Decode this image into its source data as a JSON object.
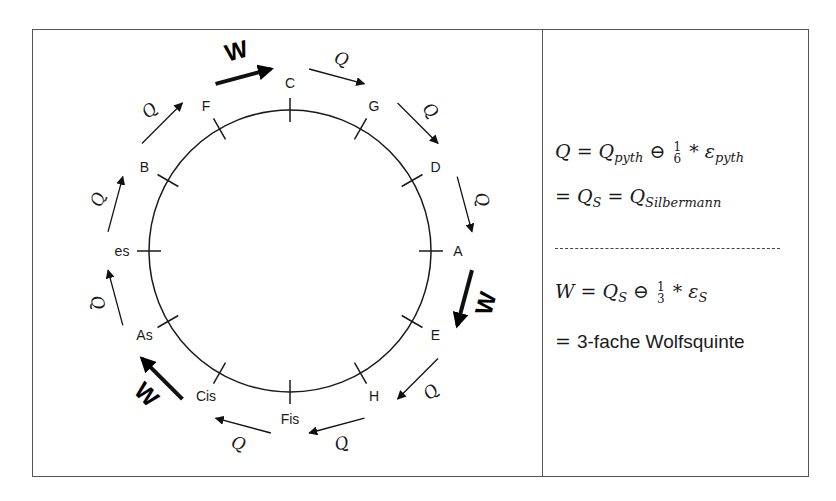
{
  "diagram": {
    "notes": [
      {
        "name": "C",
        "angle": 0
      },
      {
        "name": "G",
        "angle": 30
      },
      {
        "name": "D",
        "angle": 60
      },
      {
        "name": "A",
        "angle": 90
      },
      {
        "name": "E",
        "angle": 120
      },
      {
        "name": "H",
        "angle": 150
      },
      {
        "name": "Fis",
        "angle": 180
      },
      {
        "name": "Cis",
        "angle": 210
      },
      {
        "name": "As",
        "angle": 240
      },
      {
        "name": "es",
        "angle": 270
      },
      {
        "name": "B",
        "angle": 300
      },
      {
        "name": "F",
        "angle": 330
      }
    ],
    "intervals": [
      {
        "from": "C",
        "to": "G",
        "label": "Q",
        "type": "quint"
      },
      {
        "from": "G",
        "to": "D",
        "label": "Q",
        "type": "quint"
      },
      {
        "from": "D",
        "to": "A",
        "label": "Q",
        "type": "quint"
      },
      {
        "from": "A",
        "to": "E",
        "label": "W",
        "type": "wolf"
      },
      {
        "from": "E",
        "to": "H",
        "label": "Q",
        "type": "quint"
      },
      {
        "from": "H",
        "to": "Fis",
        "label": "Q",
        "type": "quint"
      },
      {
        "from": "Fis",
        "to": "Cis",
        "label": "Q",
        "type": "quint"
      },
      {
        "from": "Cis",
        "to": "As",
        "label": "W",
        "type": "wolf"
      },
      {
        "from": "As",
        "to": "es",
        "label": "Q",
        "type": "quint"
      },
      {
        "from": "es",
        "to": "B",
        "label": "Q",
        "type": "quint"
      },
      {
        "from": "B",
        "to": "F",
        "label": "Q",
        "type": "quint"
      },
      {
        "from": "F",
        "to": "C",
        "label": "W",
        "type": "wolf"
      }
    ]
  },
  "formulas": {
    "line1": {
      "lhs": "Q",
      "eq": "=",
      "term": "Q",
      "term_sub": "pyth",
      "op": "⊖",
      "frac_num": "1",
      "frac_den": "6",
      "mul": "*",
      "eps": "ε",
      "eps_sub": "pyth"
    },
    "line2": {
      "eq1": "=",
      "q1": "Q",
      "q1_sub": "S",
      "eq2": "=",
      "q2": "Q",
      "q2_sub": "Silbermann"
    },
    "line3": {
      "lhs": "W",
      "eq": "=",
      "term": "Q",
      "term_sub": "S",
      "op": "⊖",
      "frac_num": "1",
      "frac_den": "3",
      "mul": "*",
      "eps": "ε",
      "eps_sub": "S"
    },
    "line4": {
      "eq": "=",
      "text": "3-fache Wolfsquinte"
    }
  },
  "colors": {
    "line": "#1a1a1a",
    "frame": "#555555",
    "background": "#ffffff"
  }
}
